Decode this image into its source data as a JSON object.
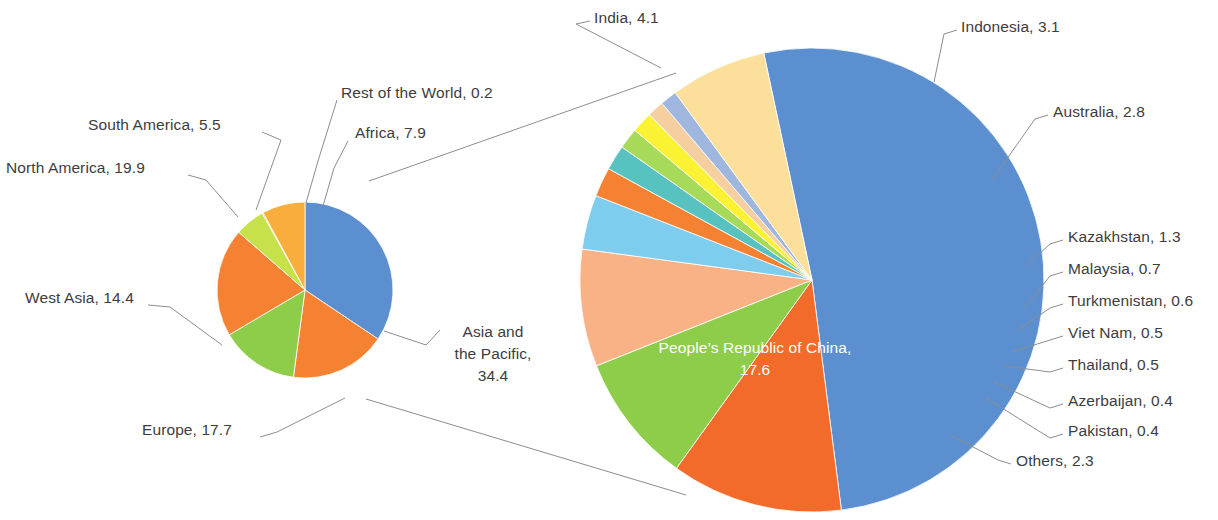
{
  "chart_data": {
    "type": "pie",
    "title": "",
    "subtitle": "",
    "xlabel": "",
    "ylabel": "",
    "legend_position": "none",
    "grid": false,
    "note": "Pie of pie: left overview pie broken out into right detail pie for the Asia and the Pacific slice",
    "charts": [
      {
        "id": "overview",
        "type": "pie",
        "name": "Regional shares",
        "start_angle_deg": 0,
        "direction": "clockwise",
        "categories": [
          "Asia and the Pacific",
          "Europe",
          "West Asia",
          "North America",
          "South America",
          "Rest of the World",
          "Africa"
        ],
        "values": [
          34.4,
          17.7,
          14.4,
          19.9,
          5.5,
          0.2,
          7.9
        ],
        "colors": [
          "#5b8fd0",
          "#f58232",
          "#8dcd4a",
          "#f58232",
          "#c6e14a",
          "#f9ad3c",
          "#f9ad3c"
        ],
        "slices": [
          {
            "label": "Asia and the Pacific",
            "value": 34.4,
            "color": "#5b8fd0",
            "label_text": "Asia and\nthe Pacific,\n34.4"
          },
          {
            "label": "Europe",
            "value": 17.7,
            "color": "#f58232",
            "label_text": "Europe, 17.7"
          },
          {
            "label": "West Asia",
            "value": 14.4,
            "color": "#8dcd4a",
            "label_text": "West Asia, 14.4"
          },
          {
            "label": "North America",
            "value": 19.9,
            "color": "#f58232",
            "label_text": "North America, 19.9"
          },
          {
            "label": "South America",
            "value": 5.5,
            "color": "#c6e14a",
            "label_text": "South America, 5.5"
          },
          {
            "label": "Rest of the World",
            "value": 0.2,
            "color": "#f9ad3c",
            "label_text": "Rest of the World, 0.2"
          },
          {
            "label": "Africa",
            "value": 7.9,
            "color": "#f9ad3c",
            "label_text": "Africa, 7.9"
          }
        ]
      },
      {
        "id": "detail",
        "type": "pie",
        "name": "Asia and the Pacific breakdown",
        "start_angle_deg": -12,
        "direction": "clockwise",
        "categories": [
          "People's Republic of China",
          "India",
          "Indonesia",
          "Australia",
          "Kazakhstan",
          "Malaysia",
          "Turkmenistan",
          "Viet Nam",
          "Thailand",
          "Azerbaijan",
          "Pakistan",
          "Others"
        ],
        "values": [
          17.6,
          4.1,
          3.1,
          2.8,
          1.3,
          0.7,
          0.6,
          0.5,
          0.5,
          0.4,
          0.4,
          2.3
        ],
        "colors": [
          "#5b8fd0",
          "#f26b2a",
          "#8dcd4a",
          "#f9b285",
          "#7fcdee",
          "#f58232",
          "#58c2c0",
          "#a8da5a",
          "#fbf233",
          "#f6cfa0",
          "#9fb6de",
          "#fbdf9b"
        ],
        "slices": [
          {
            "label": "People's Republic of China",
            "value": 17.6,
            "color": "#5b8fd0",
            "label_text": "People's Republic of China,\n17.6",
            "inside": true
          },
          {
            "label": "India",
            "value": 4.1,
            "color": "#f26b2a",
            "label_text": "India, 4.1"
          },
          {
            "label": "Indonesia",
            "value": 3.1,
            "color": "#8dcd4a",
            "label_text": "Indonesia, 3.1"
          },
          {
            "label": "Australia",
            "value": 2.8,
            "color": "#f9b285",
            "label_text": "Australia, 2.8"
          },
          {
            "label": "Kazakhstan",
            "value": 1.3,
            "color": "#7fcdee",
            "label_text": "Kazakhstan, 1.3"
          },
          {
            "label": "Malaysia",
            "value": 0.7,
            "color": "#f58232",
            "label_text": "Malaysia, 0.7"
          },
          {
            "label": "Turkmenistan",
            "value": 0.6,
            "color": "#58c2c0",
            "label_text": "Turkmenistan, 0.6"
          },
          {
            "label": "Viet Nam",
            "value": 0.5,
            "color": "#a8da5a",
            "label_text": "Viet Nam, 0.5"
          },
          {
            "label": "Thailand",
            "value": 0.5,
            "color": "#fbf233",
            "label_text": "Thailand, 0.5"
          },
          {
            "label": "Azerbaijan",
            "value": 0.4,
            "color": "#f6cfa0",
            "label_text": "Azerbaijan, 0.4"
          },
          {
            "label": "Pakistan",
            "value": 0.4,
            "color": "#9fb6de",
            "label_text": "Pakistan, 0.4"
          },
          {
            "label": "Others",
            "value": 2.3,
            "color": "#fbdf9b",
            "label_text": "Others, 2.3"
          }
        ]
      }
    ]
  },
  "labels": {
    "overview": {
      "rest_of_the_world": "Rest of the World, 0.2",
      "africa": "Africa, 7.9",
      "south_america": "South America, 5.5",
      "north_america": "North America, 19.9",
      "west_asia": "West Asia, 14.4",
      "europe": "Europe, 17.7",
      "asia_pacific_line1": "Asia and",
      "asia_pacific_line2": "the Pacific,",
      "asia_pacific_line3": "34.4"
    },
    "detail": {
      "india": "India, 4.1",
      "indonesia": "Indonesia, 3.1",
      "australia": "Australia, 2.8",
      "kazakhstan": "Kazakhstan, 1.3",
      "malaysia": "Malaysia, 0.7",
      "turkmenistan": "Turkmenistan, 0.6",
      "viet_nam": "Viet Nam, 0.5",
      "thailand": "Thailand, 0.5",
      "azerbaijan": "Azerbaijan, 0.4",
      "pakistan": "Pakistan, 0.4",
      "others": "Others, 2.3",
      "prc_line1": "People’s Republic of China,",
      "prc_line2": "17.6"
    }
  },
  "colors": {
    "leader_line": "#8d8d8d",
    "connector": "#8d8d8d",
    "text": "#3d3d3d",
    "inside_text": "#ffffff",
    "background": "#ffffff"
  }
}
